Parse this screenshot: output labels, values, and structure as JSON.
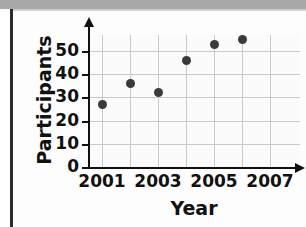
{
  "chart_data": {
    "type": "scatter",
    "title": "",
    "xlabel": "Year",
    "ylabel": "Participants",
    "x": [
      2001,
      2002,
      2003,
      2004,
      2005,
      2006
    ],
    "values": [
      27,
      36,
      32,
      46,
      53,
      55
    ],
    "points": [
      {
        "x": 2001,
        "y": 27
      },
      {
        "x": 2002,
        "y": 36
      },
      {
        "x": 2003,
        "y": 32
      },
      {
        "x": 2004,
        "y": 46
      },
      {
        "x": 2005,
        "y": 53
      },
      {
        "x": 2006,
        "y": 55
      }
    ],
    "xlim": [
      2000,
      2007
    ],
    "ylim": [
      0,
      58
    ],
    "x_ticks": [
      2001,
      2002,
      2003,
      2004,
      2005,
      2006,
      2007
    ],
    "x_tick_labels": [
      "2001",
      "",
      "2003",
      "",
      "2005",
      "",
      "2007"
    ],
    "y_ticks": [
      0,
      10,
      20,
      30,
      40,
      50
    ],
    "y_tick_labels": [
      "0",
      "10",
      "20",
      "30",
      "40",
      "50"
    ],
    "grid": true,
    "legend": null,
    "marker_color": "#3a3a3a",
    "grid_color": "#c9c9c9",
    "axis_color": "#111111"
  },
  "axis_titles": {
    "x": "Year",
    "y": "Participants"
  }
}
